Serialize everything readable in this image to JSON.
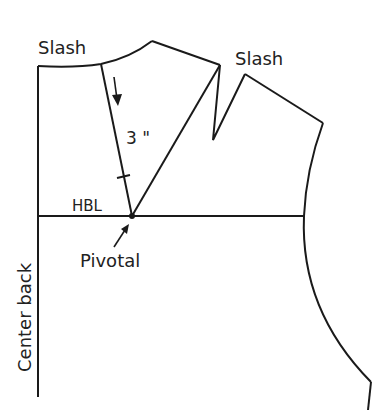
{
  "diagram": {
    "labels": {
      "slash_left": "Slash",
      "slash_right": "Slash",
      "measurement": "3 \"",
      "hbl": "HBL",
      "pivotal": "Pivotal",
      "center_back": "Center back"
    },
    "colors": {
      "line": "#1a1a1a",
      "text": "#222222",
      "background": "#ffffff"
    }
  }
}
